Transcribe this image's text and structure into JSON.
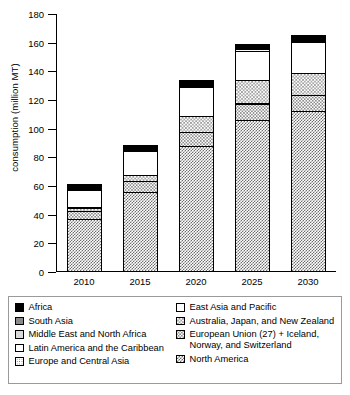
{
  "chart_data": {
    "type": "bar",
    "title": "",
    "xlabel": "",
    "ylabel": "consumption (million MT)",
    "categories": [
      "2010",
      "2015",
      "2020",
      "2025",
      "2030"
    ],
    "ylim": [
      0,
      180
    ],
    "yticks": [
      0,
      20,
      40,
      60,
      80,
      100,
      120,
      140,
      160,
      180
    ],
    "grid": false,
    "stacked": true,
    "legend_position": "bottom",
    "series": [
      {
        "name": "North America",
        "pattern": "checker-dark",
        "values": [
          37,
          56,
          88,
          106,
          112
        ]
      },
      {
        "name": "European Union (27) + Iceland, Norway, and Switzerland",
        "pattern": "dots-light",
        "values": [
          6,
          8,
          10,
          12,
          12
        ]
      },
      {
        "name": "Australia, Japan, and New Zealand",
        "pattern": "checker-med",
        "values": [
          3,
          5,
          12,
          17,
          16
        ]
      },
      {
        "name": "East Asia and Pacific",
        "pattern": "white",
        "values": [
          13,
          17,
          21,
          21,
          22
        ]
      },
      {
        "name": "Europe and Central Asia",
        "pattern": "dots-fine",
        "values": [
          1,
          1.2,
          1.5,
          1.6,
          1.6
        ]
      },
      {
        "name": "Latin America and the Caribbean",
        "pattern": "white",
        "values": [
          0.8,
          1,
          1.2,
          1.2,
          1.2
        ]
      },
      {
        "name": "Middle East and North Africa",
        "pattern": "ltgrey",
        "values": [
          0.6,
          0.8,
          0.9,
          0.9,
          0.9
        ]
      },
      {
        "name": "South Asia",
        "pattern": "grey",
        "values": [
          0.6,
          0.8,
          0.9,
          0.9,
          0.9
        ]
      },
      {
        "name": "Africa",
        "pattern": "black",
        "values": [
          1.3,
          1.5,
          1.8,
          1.8,
          1.8
        ]
      }
    ],
    "totals": [
      62,
      90,
      136,
      161,
      167
    ]
  },
  "axis": {
    "y_label": "consumption (million MT)",
    "y_ticks": [
      "0",
      "20",
      "40",
      "60",
      "80",
      "100",
      "120",
      "140",
      "160",
      "180"
    ],
    "x_ticks": [
      "2010",
      "2015",
      "2020",
      "2025",
      "2030"
    ]
  },
  "legend": {
    "left_column": [
      {
        "label": "Africa",
        "swatch": "black-swatch"
      },
      {
        "label": "South Asia",
        "swatch": "grey-swatch"
      },
      {
        "label": "Middle East and North Africa",
        "swatch": "light-grey-swatch"
      },
      {
        "label": "Latin America and the Caribbean",
        "swatch": "white-swatch"
      },
      {
        "label": "Europe and Central Asia",
        "swatch": "fine-dot-swatch"
      }
    ],
    "right_column": [
      {
        "label": "East Asia and Pacific",
        "swatch": "white-swatch"
      },
      {
        "label": "Australia, Japan, and New Zealand",
        "swatch": "medium-checker-swatch"
      },
      {
        "label": "European Union (27) + Iceland, Norway, and Switzerland",
        "swatch": "light-dot-swatch"
      },
      {
        "label": "North America",
        "swatch": "dark-checker-swatch"
      }
    ]
  }
}
